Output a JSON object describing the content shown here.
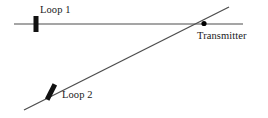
{
  "figure": {
    "background_color": "#ffffff",
    "width": 268,
    "height": 118
  },
  "labels": {
    "loop1": "Loop 1",
    "loop2": "Loop 2",
    "transmitter": "Transmitter"
  },
  "colors": {
    "line": "#4d4d4d",
    "marker": "#111111",
    "dot": "#000000",
    "text": "#1a1a1a"
  },
  "geometry": {
    "bearing_line_1": {
      "name": "loop-1-bearing-line",
      "x1": 14,
      "y1": 24,
      "x2": 243,
      "y2": 24,
      "stroke_width": 1.1
    },
    "bearing_line_2": {
      "name": "loop-2-bearing-line",
      "x1": 24,
      "y1": 110,
      "x2": 229,
      "y2": 7,
      "stroke_width": 1.3
    },
    "loop_1_marker": {
      "name": "loop-1-antenna-marker",
      "cx": 36,
      "cy": 24,
      "width": 5,
      "height": 16,
      "rotation": 0
    },
    "loop_2_marker": {
      "name": "loop-2-antenna-marker",
      "cx": 51,
      "cy": 92,
      "width": 5,
      "height": 17,
      "rotation": 27
    },
    "transmitter_point": {
      "name": "transmitter-point",
      "cx": 204,
      "cy": 23.5,
      "r": 2.6
    }
  }
}
